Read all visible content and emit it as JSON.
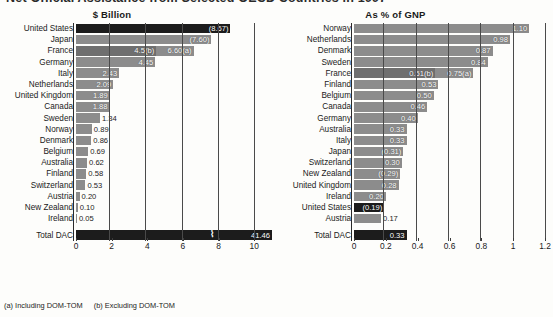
{
  "title": "Net Official Assistance from Selected OECD Countries in 1997",
  "footnotes": {
    "a": "(a) Including DOM-TOM",
    "b": "(b) Excluding DOM-TOM"
  },
  "chart_data": [
    {
      "type": "bar",
      "orientation": "horizontal",
      "title": "$ Billion",
      "subtitle": "$ Billion",
      "xlabel": "",
      "ylabel": "",
      "xlim": [
        0,
        11
      ],
      "xticks": [
        "0",
        "2",
        "4",
        "6",
        "8",
        "10"
      ],
      "xtick_values": [
        0,
        2,
        4,
        6,
        8,
        10
      ],
      "grid": true,
      "legend": "none",
      "note": "Total DAC bar is drawn with an axis break; its true value 41.46 exceeds the axis maximum.",
      "categories": [
        "United States",
        "Japan",
        "France",
        "Germany",
        "Italy",
        "Netherlands",
        "United Kingdom",
        "Canada",
        "Sweden",
        "Norway",
        "Denmark",
        "Belgium",
        "Australia",
        "Finland",
        "Switzerland",
        "Austria",
        "New Zealand",
        "Ireland",
        "Total DAC"
      ],
      "values": [
        8.67,
        7.6,
        6.6,
        4.45,
        2.43,
        2.09,
        1.89,
        1.88,
        1.34,
        0.89,
        0.86,
        0.69,
        0.62,
        0.58,
        0.53,
        0.2,
        0.1,
        0.05,
        41.46
      ],
      "value_labels": [
        "(8.67)",
        "(7.60)",
        "6.60(a)",
        "4.45",
        "2.43",
        "2.09",
        "1.89",
        "1.88",
        "1.34",
        "0.89",
        "0.86",
        "0.69",
        "0.62",
        "0.58",
        "0.53",
        "0.20",
        "0.10",
        "0.05",
        "41.46"
      ],
      "secondary_labels": {
        "France": "4.5(b)"
      },
      "secondary_values": {
        "France": 4.5
      },
      "highlight": "United States"
    },
    {
      "type": "bar",
      "orientation": "horizontal",
      "title": "As % of GNP",
      "subtitle": "As % of GNP",
      "xlabel": "",
      "ylabel": "",
      "xlim": [
        0,
        1.25
      ],
      "xticks": [
        "0",
        "0.2",
        "0.4",
        "0.6",
        "0.8",
        "1",
        "1.2"
      ],
      "xtick_values": [
        0,
        0.2,
        0.4,
        0.6,
        0.8,
        1,
        1.2
      ],
      "grid": true,
      "legend": "none",
      "categories": [
        "Norway",
        "Netherlands",
        "Denmark",
        "Sweden",
        "France",
        "Finland",
        "Belgium",
        "Canada",
        "Germany",
        "Australia",
        "Italy",
        "Japan",
        "Switzerland",
        "New Zealand",
        "United Kingdom",
        "Ireland",
        "United States",
        "Austria",
        "Total DAC"
      ],
      "values": [
        1.1,
        0.98,
        0.87,
        0.84,
        0.75,
        0.53,
        0.5,
        0.46,
        0.4,
        0.33,
        0.33,
        0.31,
        0.3,
        0.29,
        0.28,
        0.2,
        0.19,
        0.17,
        0.33
      ],
      "value_labels": [
        "1.10",
        "0.98",
        "0.87",
        "0.84",
        "0.75(a)",
        "0.53",
        "0.50",
        "0.46",
        "0.40",
        "0.33",
        "0.33",
        "(0.31)",
        "0.30",
        "(0.29)",
        "0.28",
        "0.20",
        "(0.19)",
        "0.17",
        "0.33"
      ],
      "secondary_labels": {
        "France": "0.51(b)"
      },
      "secondary_values": {
        "France": 0.51
      },
      "highlight": "United States"
    }
  ]
}
